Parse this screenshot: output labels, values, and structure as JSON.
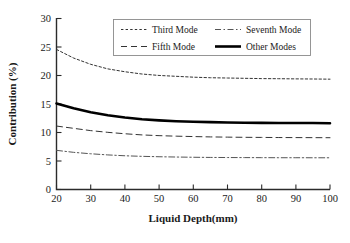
{
  "chart_data": {
    "type": "line",
    "title": "",
    "xlabel": "Liquid Depth(mm)",
    "ylabel": "Contribution (%)",
    "xlim": [
      20,
      100
    ],
    "ylim": [
      0,
      30
    ],
    "xticks": [
      20,
      30,
      40,
      50,
      60,
      70,
      80,
      90,
      100
    ],
    "yticks": [
      0,
      5,
      10,
      15,
      20,
      25,
      30
    ],
    "grid": false,
    "legend_position": "top-center",
    "x": [
      20,
      25,
      30,
      35,
      40,
      45,
      50,
      55,
      60,
      65,
      70,
      75,
      80,
      85,
      90,
      95,
      100
    ],
    "series": [
      {
        "name": "Third Mode",
        "style": "dotted",
        "color": "#333333",
        "width": 1.0,
        "values": [
          24.5,
          23.0,
          21.9,
          21.1,
          20.6,
          20.2,
          19.95,
          19.8,
          19.65,
          19.55,
          19.5,
          19.45,
          19.4,
          19.38,
          19.35,
          19.33,
          19.3
        ]
      },
      {
        "name": "Fifth Mode",
        "style": "dashed",
        "color": "#333333",
        "width": 1.0,
        "values": [
          11.1,
          10.7,
          10.3,
          10.0,
          9.75,
          9.55,
          9.42,
          9.33,
          9.26,
          9.2,
          9.16,
          9.13,
          9.11,
          9.09,
          9.08,
          9.07,
          9.06
        ]
      },
      {
        "name": "Seventh Mode",
        "style": "dashdot",
        "color": "#555555",
        "width": 1.0,
        "values": [
          6.85,
          6.5,
          6.25,
          6.05,
          5.9,
          5.8,
          5.73,
          5.68,
          5.64,
          5.61,
          5.59,
          5.58,
          5.57,
          5.56,
          5.56,
          5.55,
          5.55
        ]
      },
      {
        "name": "Other Modes",
        "style": "solid",
        "color": "#000000",
        "width": 2.6,
        "values": [
          15.05,
          14.2,
          13.5,
          13.0,
          12.6,
          12.3,
          12.1,
          11.95,
          11.85,
          11.78,
          11.72,
          11.68,
          11.66,
          11.64,
          11.63,
          11.62,
          11.6
        ]
      }
    ],
    "legend_entries": [
      {
        "label": "Third Mode",
        "style": "dotted"
      },
      {
        "label": "Seventh Mode",
        "style": "dashdot"
      },
      {
        "label": "Fifth Mode",
        "style": "dashed"
      },
      {
        "label": "Other Modes",
        "style": "solid"
      }
    ]
  }
}
